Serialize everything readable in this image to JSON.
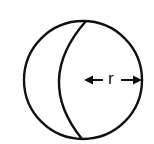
{
  "diagram": {
    "radius_label": "r",
    "stroke_color": "#111111",
    "background": "#ffffff"
  }
}
